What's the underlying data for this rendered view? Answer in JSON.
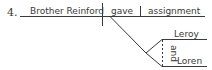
{
  "diagram": {
    "type": "sentence-diagram",
    "item_number": "4.",
    "subject": "Brother Reinford",
    "verb": "gave",
    "direct_object": "assignment",
    "indirect_object": {
      "conjunction": "and",
      "words": [
        "Leroy",
        "Loren"
      ]
    }
  }
}
